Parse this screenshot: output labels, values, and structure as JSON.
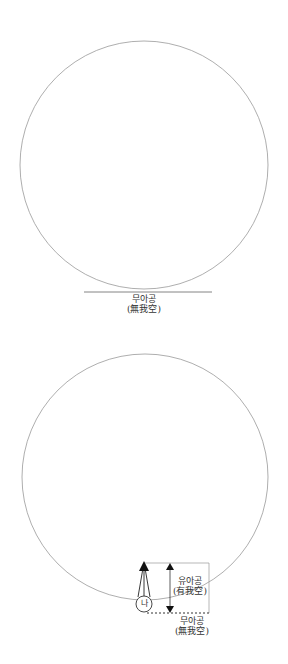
{
  "diagram_top": {
    "description": "Large circle resting on a horizontal line",
    "label_korean": "무아공",
    "label_hanja": "(無我空)"
  },
  "diagram_bottom": {
    "description": "Large circle with small inner circle '나' and upward arrows, measured height bracket",
    "self_label": "나",
    "upper_label_korean": "유아공",
    "upper_label_hanja": "(有我空)",
    "lower_label_korean": "무아공",
    "lower_label_hanja": "(無我空)"
  },
  "colors": {
    "circle_stroke": "#888888",
    "line": "#555555",
    "arrow": "#111111"
  }
}
